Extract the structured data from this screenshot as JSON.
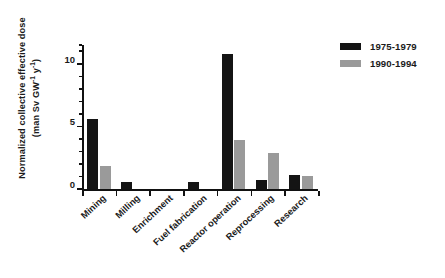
{
  "chart_data": {
    "type": "bar",
    "title": "",
    "subtitle": "",
    "xlabel": "",
    "ylabel": "Normalized collective effective dose (man Sv GW⁻¹ y⁻¹)",
    "ylabel_line1": "Normalized collective effective dose",
    "ylabel_line2_prefix": "(man Sv GW",
    "ylabel_line2_sup1": "-1",
    "ylabel_line2_mid": " y",
    "ylabel_line2_sup2": "-1",
    "ylabel_line2_suffix": ")",
    "categories": [
      "Mining",
      "Milling",
      "Enrichment",
      "Fuel fabrication",
      "Reactor operation",
      "Reprocessing",
      "Research"
    ],
    "series": [
      {
        "name": "1975-1979",
        "color": "#141414",
        "values": [
          5.6,
          0.6,
          0.02,
          0.6,
          10.8,
          0.7,
          1.1
        ]
      },
      {
        "name": "1990-1994",
        "color": "#9a9a9a",
        "values": [
          1.8,
          0.0,
          0.0,
          0.0,
          3.9,
          2.9,
          1.0
        ]
      }
    ],
    "ylim": [
      0,
      11.5
    ],
    "y_major_ticks": [
      0,
      5,
      10
    ],
    "y_major_tick_labels": [
      "0",
      "5",
      "10"
    ],
    "y_minor_tick_step": 1,
    "grid": false,
    "legend_position": "top-right",
    "legend_entries": [
      "1975-1979",
      "1990-1994"
    ]
  }
}
